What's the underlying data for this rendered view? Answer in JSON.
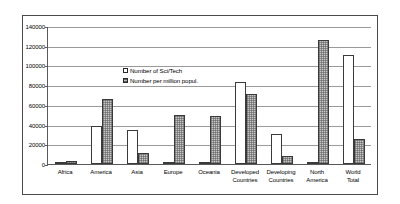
{
  "chart_data": {
    "type": "bar",
    "title": "",
    "subtitle": "",
    "xlabel": "",
    "ylabel": "",
    "ylim": [
      0,
      140000
    ],
    "ytick_labels": [
      "140000",
      "120000",
      "100000",
      "80000",
      "60000",
      "40000",
      "20000",
      "0"
    ],
    "ytick_values": [
      140000,
      120000,
      100000,
      80000,
      60000,
      40000,
      20000,
      0
    ],
    "grid": true,
    "legend_position": "inside-upper-left",
    "categories": [
      "Africa",
      "America",
      "Asia",
      "Europe",
      "Oceania",
      "Developed\nCountries",
      "Developing\nCountries",
      "North\nAmerica",
      "World\nTotal"
    ],
    "series": [
      {
        "name": "Number of Sci/Tech",
        "style": "white",
        "values": [
          900,
          39000,
          35000,
          2000,
          1800,
          83000,
          30000,
          2500,
          111000
        ]
      },
      {
        "name": "Number per million popul.",
        "style": "hatched",
        "values": [
          3500,
          66000,
          11000,
          49500,
          49000,
          71000,
          8000,
          126000,
          25000
        ]
      }
    ]
  },
  "legend": {
    "entries": [
      {
        "label": "Number of Sci/Tech"
      },
      {
        "label": "Number per million popul."
      }
    ]
  },
  "colors": {
    "frame": "#4a4a4a",
    "axis": "#5a5a5a",
    "gridline": "#9a9a9a",
    "bar_outline": "#3a3a3a",
    "series_white_fill": "#ffffff",
    "series_hatched_fill": "#c8c8c8",
    "background": "#ffffff",
    "text": "#000000"
  }
}
